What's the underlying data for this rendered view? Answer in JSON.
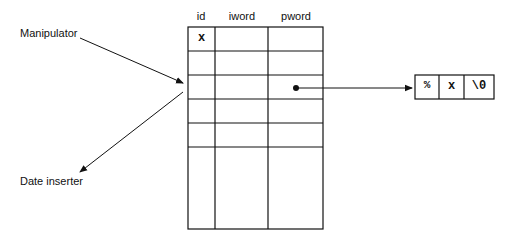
{
  "diagram": {
    "labels": {
      "manipulator": "Manipulator",
      "date_inserter": "Date inserter"
    },
    "table": {
      "columns": [
        "id",
        "iword",
        "pword"
      ],
      "rows": [
        [
          "x",
          "",
          ""
        ],
        [
          "",
          "",
          ""
        ],
        [
          "",
          "",
          "•"
        ],
        [
          "",
          "",
          ""
        ],
        [
          "",
          "",
          ""
        ],
        [
          "",
          "",
          ""
        ]
      ]
    },
    "string_cells": [
      "%",
      "x",
      "\\0"
    ],
    "colors": {
      "line": "#111111",
      "background": "#ffffff"
    }
  }
}
